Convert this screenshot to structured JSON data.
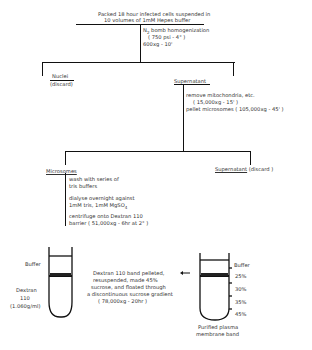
{
  "diagram": {
    "start": {
      "line1": "Packed 18 hour infected cells suspended in",
      "line2": "10 volumes of 1mM Hepes buffer"
    },
    "step1": {
      "prefix": "N",
      "sub": "2",
      "line1": " bomb homogenization",
      "line2": "( 750 psi   - 4° )",
      "line3": "600xg - 10'"
    },
    "nuclei": {
      "label": "Nuclei",
      "note": "(discard)"
    },
    "supernatant": {
      "label": "Supernatant",
      "step_line1": "remove mitochondria, etc.",
      "step_line2": "( 15,000xg - 15' )",
      "step_line3": "pellet microsomes ( 105,000xg - 45' )"
    },
    "microsomes": {
      "label": "Microsomes",
      "wash1": "wash with series of",
      "wash2": "tris buffers",
      "dialyse1": "dialyse overnight against",
      "dialyse2_a": "1mM tris, 1mM  MgSO",
      "dialyse2_sub": "4",
      "cent1": "centrifuge onto Dextran 110",
      "cent2": "barrier ( 51,000xg - 6hr at 2° )"
    },
    "supernatant2": {
      "label": "Supernatant",
      "note": " (discard )"
    },
    "tube_left": {
      "buffer": "Buffer",
      "medium1": "Dextran",
      "medium2": "110",
      "medium3": "(1.060g/ml)"
    },
    "transfer": {
      "line1": "Dextran 110 band pelleted,",
      "line2": "resuspended, made 45%",
      "line3": "sucrose, and floated through",
      "line4": "a discontinuous sucrose gradient",
      "line5": "( 78,000xg - 20hr )"
    },
    "tube_right": {
      "layers": [
        "Buffer",
        "25%",
        "30%",
        "35%",
        "45%"
      ],
      "result1": "Purified plasma",
      "result2": "membrane band"
    }
  }
}
